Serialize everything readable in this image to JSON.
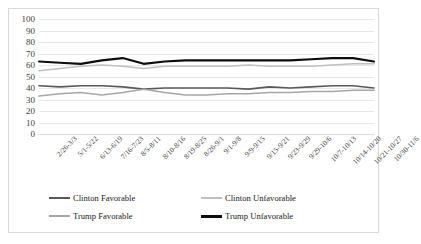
{
  "chart_data": {
    "type": "line",
    "title": "",
    "xlabel": "",
    "ylabel": "",
    "ylim": [
      0,
      100
    ],
    "ytick_step": 10,
    "grid": true,
    "legend_position": "bottom",
    "categories": [
      "2/26-3/3",
      "5/1-5/22",
      "6/13-6/19",
      "7/16-7/23",
      "8/5-8/11",
      "8/10-8/16",
      "8/19-8/25",
      "8/26-9/1",
      "9/1-9/8",
      "9/9-9/15",
      "9/15-9/21",
      "9/23-9/29",
      "9/29-10/6",
      "10/7-10/13",
      "10/14-10/20",
      "10/21-10/27",
      "10/30-11/6"
    ],
    "ytick_labels": [
      "100",
      "90",
      "80",
      "70",
      "60",
      "50",
      "40",
      "30",
      "20",
      "10",
      "0"
    ],
    "series": [
      {
        "name": "Clinton Favorable",
        "color": "#595959",
        "width": 1.6,
        "values": [
          42,
          41,
          42,
          42,
          41,
          39,
          40,
          40,
          40,
          40,
          39,
          41,
          40,
          41,
          42,
          42,
          40
        ]
      },
      {
        "name": "Clinton Unfavorable",
        "color": "#bfbfbf",
        "width": 1.5,
        "values": [
          55,
          57,
          59,
          60,
          59,
          57,
          59,
          59,
          59,
          59,
          60,
          59,
          59,
          59,
          60,
          61,
          61
        ]
      },
      {
        "name": "Trump Favorable",
        "color": "#a6a6a6",
        "width": 1.5,
        "values": [
          33,
          35,
          36,
          34,
          36,
          39,
          36,
          34,
          34,
          35,
          35,
          36,
          36,
          37,
          37,
          38,
          38
        ]
      },
      {
        "name": "Trump Unfavorable",
        "color": "#0d0d0d",
        "width": 2.1,
        "values": [
          63,
          62,
          61,
          64,
          66,
          61,
          63,
          64,
          64,
          64,
          64,
          64,
          64,
          65,
          66,
          66,
          63
        ]
      }
    ]
  },
  "legend": {
    "items": [
      {
        "label": "Clinton Favorable",
        "color": "#595959",
        "width": 2.4
      },
      {
        "label": "Clinton Unfavorable",
        "color": "#bfbfbf",
        "width": 2.0
      },
      {
        "label": "Trump Favorable",
        "color": "#a6a6a6",
        "width": 2.0
      },
      {
        "label": "Trump Unfavorable",
        "color": "#0d0d0d",
        "width": 3.0
      }
    ]
  },
  "colors": {
    "gridline": "#e8e8e8",
    "frame_border": "#d9d9d9",
    "axis_text": "#404040",
    "background": "#ffffff"
  }
}
